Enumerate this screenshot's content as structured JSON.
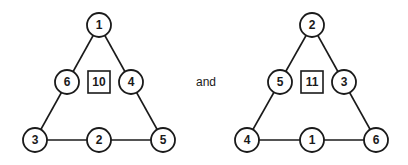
{
  "connector_text": "and",
  "triangles": [
    {
      "name": "left",
      "sum": "10",
      "nodes": {
        "top": "1",
        "mid_left": "6",
        "mid_right": "4",
        "bottom_left": "3",
        "bottom_mid": "2",
        "bottom_right": "5"
      }
    },
    {
      "name": "right",
      "sum": "11",
      "nodes": {
        "top": "2",
        "mid_left": "5",
        "mid_right": "3",
        "bottom_left": "4",
        "bottom_mid": "1",
        "bottom_right": "6"
      }
    }
  ]
}
